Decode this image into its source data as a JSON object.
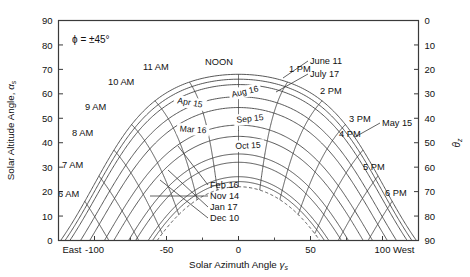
{
  "figure": {
    "name": "sun-path-diagram",
    "latitude_annotation": "ϕ = ±45°",
    "noon_label": "NOON"
  },
  "axes": {
    "left": {
      "title": "Solar Altitude Angle,",
      "symbol": "α",
      "subscript": "s",
      "ticks": [
        0,
        10,
        20,
        30,
        40,
        50,
        60,
        70,
        80,
        90
      ],
      "min": 0,
      "max": 90
    },
    "right": {
      "symbol": "θ",
      "subscript": "z",
      "ticks": [
        0,
        10,
        20,
        30,
        40,
        50,
        60,
        70,
        80,
        90
      ],
      "min": 0,
      "max": 90,
      "inverted": true
    },
    "bottom": {
      "title": "Solar Azimuth Angle",
      "symbol": "γ",
      "subscript": "s",
      "ticks": [
        -100,
        -50,
        0,
        50,
        100
      ],
      "min": -125,
      "max": 125,
      "left_end_label": "East",
      "right_end_label": "West"
    }
  },
  "hour_labels": [
    {
      "label": "6 AM",
      "hour": 6
    },
    {
      "label": "7 AM",
      "hour": 7
    },
    {
      "label": "8 AM",
      "hour": 8
    },
    {
      "label": "9 AM",
      "hour": 9
    },
    {
      "label": "10 AM",
      "hour": 10
    },
    {
      "label": "11 AM",
      "hour": 11
    },
    {
      "label": "NOON",
      "hour": 12
    },
    {
      "label": "1 PM",
      "hour": 13
    },
    {
      "label": "2 PM",
      "hour": 14
    },
    {
      "label": "3 PM",
      "hour": 15
    },
    {
      "label": "4 PM",
      "hour": 16
    },
    {
      "label": "5 PM",
      "hour": 17
    },
    {
      "label": "6 PM",
      "hour": 18
    }
  ],
  "date_curves": [
    {
      "label": "June 11",
      "declination": 23.0,
      "leader": true,
      "dashed": false
    },
    {
      "label": "July 17",
      "declination": 21.0,
      "leader": true,
      "dashed": false
    },
    {
      "label": "May 15",
      "declination": 18.8,
      "leader": true,
      "dashed": false
    },
    {
      "label": "Aug 16",
      "declination": 13.8,
      "leader": false,
      "dashed": false
    },
    {
      "label": "Apr 15",
      "declination": 9.4,
      "leader": false,
      "dashed": false
    },
    {
      "label": "Sep 15",
      "declination": 2.2,
      "leader": false,
      "dashed": false
    },
    {
      "label": "Mar 16",
      "declination": -2.4,
      "leader": false,
      "dashed": false
    },
    {
      "label": "Oct 15",
      "declination": -9.6,
      "leader": false,
      "dashed": false
    },
    {
      "label": "Feb 16",
      "declination": -13.0,
      "leader": true,
      "dashed": false
    },
    {
      "label": "Nov 14",
      "declination": -18.9,
      "leader": true,
      "dashed": false
    },
    {
      "label": "Jan 17",
      "declination": -20.9,
      "leader": true,
      "dashed": false
    },
    {
      "label": "Dec 10",
      "declination": -23.0,
      "leader": true,
      "dashed": true
    }
  ],
  "chart_data": {
    "type": "line",
    "title": "",
    "xlabel": "Solar Azimuth Angle γs",
    "ylabel": "Solar Altitude Angle αs",
    "xlim": [
      -125,
      125
    ],
    "ylim": [
      0,
      90
    ],
    "grid": false,
    "legend": "none",
    "latitude_deg": 45,
    "annotations": [
      "ϕ = ±45°",
      "East",
      "West",
      "NOON"
    ],
    "series": [
      {
        "name": "June 11",
        "declination_deg": 23.0,
        "points": [
          [
            -117.6,
            0
          ],
          [
            -108.4,
            10.5
          ],
          [
            -98.5,
            20.6
          ],
          [
            -86.8,
            30.0
          ],
          [
            -71.8,
            38.4
          ],
          [
            -51.9,
            44.9
          ],
          [
            -27.6,
            48.5
          ],
          [
            0,
            49.0
          ],
          [
            27.6,
            48.5
          ],
          [
            51.9,
            44.9
          ],
          [
            71.8,
            38.4
          ],
          [
            86.8,
            30.0
          ],
          [
            98.5,
            20.6
          ],
          [
            108.4,
            10.5
          ],
          [
            117.6,
            0
          ]
        ]
      },
      {
        "name": "July 17",
        "declination_deg": 21.0,
        "points": [
          [
            -114.9,
            0
          ],
          [
            -105.6,
            9.9
          ],
          [
            -95.5,
            19.7
          ],
          [
            -83.8,
            28.8
          ],
          [
            -69.2,
            36.9
          ],
          [
            -50.2,
            43.0
          ],
          [
            -26.9,
            46.5
          ],
          [
            0,
            47.0
          ],
          [
            26.9,
            46.5
          ],
          [
            50.2,
            43.0
          ],
          [
            69.2,
            36.9
          ],
          [
            83.8,
            28.8
          ],
          [
            95.5,
            19.7
          ],
          [
            105.6,
            9.9
          ],
          [
            114.9,
            0
          ]
        ]
      },
      {
        "name": "May 15",
        "declination_deg": 18.8,
        "points": [
          [
            -111.9,
            0
          ],
          [
            -102.6,
            9.3
          ],
          [
            -92.4,
            18.7
          ],
          [
            -80.6,
            27.5
          ],
          [
            -66.5,
            35.3
          ],
          [
            -48.4,
            41.1
          ],
          [
            -26.1,
            44.4
          ],
          [
            0,
            44.8
          ],
          [
            26.1,
            44.4
          ],
          [
            48.4,
            41.1
          ],
          [
            66.5,
            35.3
          ],
          [
            80.6,
            27.5
          ],
          [
            92.4,
            18.7
          ],
          [
            102.6,
            9.3
          ],
          [
            111.9,
            0
          ]
        ]
      },
      {
        "name": "Aug 16",
        "declination_deg": 13.8,
        "points": [
          [
            -105.3,
            0
          ],
          [
            -95.8,
            8.0
          ],
          [
            -85.5,
            16.8
          ],
          [
            -73.8,
            24.9
          ],
          [
            -60.5,
            32.0
          ],
          [
            -44.4,
            37.2
          ],
          [
            -24.1,
            40.0
          ],
          [
            0,
            40.2
          ],
          [
            24.1,
            40.0
          ],
          [
            44.4,
            37.2
          ],
          [
            60.5,
            32.0
          ],
          [
            73.8,
            24.9
          ],
          [
            85.5,
            16.8
          ],
          [
            95.8,
            8.0
          ],
          [
            105.3,
            0
          ]
        ]
      },
      {
        "name": "Apr 15",
        "declination_deg": 9.4,
        "points": [
          [
            -99.4,
            0
          ],
          [
            -89.8,
            6.8
          ],
          [
            -79.5,
            15.0
          ],
          [
            -68.0,
            22.6
          ],
          [
            -55.5,
            29.1
          ],
          [
            -40.8,
            33.8
          ],
          [
            -22.3,
            36.2
          ],
          [
            0,
            36.4
          ],
          [
            22.3,
            36.2
          ],
          [
            40.8,
            33.8
          ],
          [
            55.5,
            29.1
          ],
          [
            68.0,
            22.6
          ],
          [
            79.5,
            15.0
          ],
          [
            89.8,
            6.8
          ],
          [
            99.4,
            0
          ]
        ]
      },
      {
        "name": "Sep 15",
        "declination_deg": 2.2,
        "points": [
          [
            -89.6,
            0
          ],
          [
            -80.1,
            4.7
          ],
          [
            -70.2,
            12.0
          ],
          [
            -59.3,
            18.7
          ],
          [
            -48.0,
            24.2
          ],
          [
            -35.0,
            28.1
          ],
          [
            -18.8,
            30.0
          ],
          [
            0,
            30.2
          ],
          [
            18.8,
            30.0
          ],
          [
            35.0,
            28.1
          ],
          [
            48.0,
            24.2
          ],
          [
            59.3,
            18.7
          ],
          [
            70.2,
            12.0
          ],
          [
            80.1,
            4.7
          ],
          [
            89.6,
            0
          ]
        ]
      },
      {
        "name": "Mar 16",
        "declination_deg": -2.4,
        "points": [
          [
            -83.3,
            0
          ],
          [
            -74.1,
            3.4
          ],
          [
            -64.5,
            10.0
          ],
          [
            -54.1,
            16.1
          ],
          [
            -43.5,
            21.1
          ],
          [
            -31.5,
            24.6
          ],
          [
            -16.8,
            26.3
          ],
          [
            0,
            26.5
          ],
          [
            16.8,
            26.3
          ],
          [
            31.5,
            24.6
          ],
          [
            43.5,
            21.1
          ],
          [
            54.1,
            16.1
          ],
          [
            64.5,
            10.0
          ],
          [
            74.1,
            3.4
          ],
          [
            83.3,
            0
          ]
        ]
      },
      {
        "name": "Oct 15",
        "declination_deg": -9.6,
        "points": [
          [
            -72.9,
            0
          ],
          [
            -64.4,
            1.3
          ],
          [
            -55.6,
            6.8
          ],
          [
            -46.3,
            11.9
          ],
          [
            -36.9,
            16.2
          ],
          [
            -26.5,
            19.1
          ],
          [
            -14.0,
            20.6
          ],
          [
            0,
            20.7
          ],
          [
            14.0,
            20.6
          ],
          [
            26.5,
            19.1
          ],
          [
            36.9,
            16.2
          ],
          [
            46.3,
            11.9
          ],
          [
            55.6,
            6.8
          ],
          [
            64.4,
            1.3
          ],
          [
            72.9,
            0
          ]
        ]
      },
      {
        "name": "Feb 16",
        "declination_deg": -13.0,
        "points": [
          [
            -67.8,
            0
          ],
          [
            -59.8,
            0.3
          ],
          [
            -51.4,
            4.3
          ],
          [
            -42.5,
            8.9
          ],
          [
            -33.6,
            12.8
          ],
          [
            -24.0,
            15.4
          ],
          [
            -12.6,
            16.8
          ],
          [
            0,
            16.9
          ],
          [
            12.6,
            16.8
          ],
          [
            24.0,
            15.4
          ],
          [
            33.6,
            12.8
          ],
          [
            42.5,
            8.9
          ],
          [
            51.4,
            4.3
          ],
          [
            59.8,
            0.3
          ],
          [
            67.8,
            0
          ]
        ]
      },
      {
        "name": "Nov 14",
        "declination_deg": -18.9,
        "points": [
          [
            -58.6,
            0
          ],
          [
            -50.2,
            0.0
          ],
          [
            -43.2,
            0.6
          ],
          [
            -35.2,
            4.3
          ],
          [
            -27.5,
            7.7
          ],
          [
            -19.5,
            10.1
          ],
          [
            -10.2,
            11.2
          ],
          [
            0,
            11.3
          ],
          [
            10.2,
            11.2
          ],
          [
            19.5,
            10.1
          ],
          [
            27.5,
            7.7
          ],
          [
            35.2,
            4.3
          ],
          [
            43.2,
            0.6
          ],
          [
            50.2,
            0.0
          ],
          [
            58.6,
            0
          ]
        ]
      },
      {
        "name": "Jan 17",
        "declination_deg": -20.9,
        "points": [
          [
            -55.4,
            0
          ],
          [
            -48.0,
            0.0
          ],
          [
            -40.4,
            0.0
          ],
          [
            -32.4,
            2.5
          ],
          [
            -25.1,
            5.8
          ],
          [
            -17.8,
            8.1
          ],
          [
            -9.3,
            9.2
          ],
          [
            0,
            9.3
          ],
          [
            9.3,
            9.2
          ],
          [
            17.8,
            8.1
          ],
          [
            25.1,
            5.8
          ],
          [
            32.4,
            2.5
          ],
          [
            40.4,
            0.0
          ],
          [
            48.0,
            0.0
          ],
          [
            55.4,
            0
          ]
        ]
      },
      {
        "name": "Dec 10",
        "declination_deg": -23.0,
        "points": [
          [
            -52.0,
            0
          ],
          [
            -45.0,
            0.0
          ],
          [
            -38.0,
            0.0
          ],
          [
            -29.5,
            0.6
          ],
          [
            -22.6,
            3.8
          ],
          [
            -16.0,
            5.9
          ],
          [
            -8.3,
            7.0
          ],
          [
            0,
            7.1
          ],
          [
            8.3,
            7.0
          ],
          [
            16.0,
            5.9
          ],
          [
            22.6,
            3.8
          ],
          [
            29.5,
            0.6
          ],
          [
            38.0,
            0.0
          ],
          [
            45.0,
            0.0
          ],
          [
            52.0,
            0
          ]
        ]
      }
    ],
    "hour_lines": [
      {
        "hour": 6,
        "label": "6 AM"
      },
      {
        "hour": 7,
        "label": "7 AM"
      },
      {
        "hour": 8,
        "label": "8 AM"
      },
      {
        "hour": 9,
        "label": "9 AM"
      },
      {
        "hour": 10,
        "label": "10 AM"
      },
      {
        "hour": 11,
        "label": "11 AM"
      },
      {
        "hour": 12,
        "label": "NOON"
      },
      {
        "hour": 13,
        "label": "1 PM"
      },
      {
        "hour": 14,
        "label": "2 PM"
      },
      {
        "hour": 15,
        "label": "3 PM"
      },
      {
        "hour": 16,
        "label": "4 PM"
      },
      {
        "hour": 17,
        "label": "5 PM"
      },
      {
        "hour": 18,
        "label": "6 PM"
      }
    ]
  }
}
